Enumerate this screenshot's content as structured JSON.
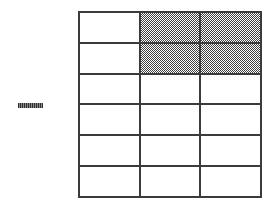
{
  "figure": {
    "title": "",
    "background_color": "#ffffff",
    "grid": {
      "columns": 3,
      "rows": 6,
      "line_color": "#3b3b3b",
      "line_width_px": 2,
      "cell_fill_empty": "#ffffff",
      "cell_fill_shaded": "#808080",
      "shaded_pattern": "checkerboard-halftone",
      "shaded_cell_count": 4,
      "total_cell_count": 18,
      "cells": [
        [
          {
            "id": "r1c1",
            "shaded": false
          },
          {
            "id": "r1c2",
            "shaded": true
          },
          {
            "id": "r1c3",
            "shaded": true
          }
        ],
        [
          {
            "id": "r2c1",
            "shaded": false
          },
          {
            "id": "r2c2",
            "shaded": true
          },
          {
            "id": "r2c3",
            "shaded": true
          }
        ],
        [
          {
            "id": "r3c1",
            "shaded": false
          },
          {
            "id": "r3c2",
            "shaded": false
          },
          {
            "id": "r3c3",
            "shaded": false
          }
        ],
        [
          {
            "id": "r4c1",
            "shaded": false
          },
          {
            "id": "r4c2",
            "shaded": false
          },
          {
            "id": "r4c3",
            "shaded": false
          }
        ],
        [
          {
            "id": "r5c1",
            "shaded": false
          },
          {
            "id": "r5c2",
            "shaded": false
          },
          {
            "id": "r5c3",
            "shaded": false
          }
        ],
        [
          {
            "id": "r6c1",
            "shaded": false
          },
          {
            "id": "r6c2",
            "shaded": false
          },
          {
            "id": "r6c3",
            "shaded": false
          }
        ]
      ]
    },
    "dash_mark": {
      "label": "",
      "color": "#555555"
    }
  }
}
